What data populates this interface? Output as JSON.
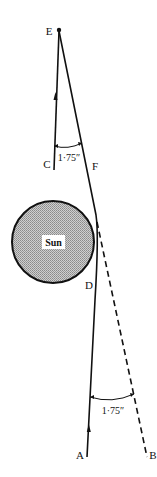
{
  "diagram": {
    "title": "",
    "points": {
      "E": "E",
      "C": "C",
      "F": "F",
      "D": "D",
      "A": "A",
      "B": "B"
    },
    "sun_label": "Sun",
    "angles": {
      "top": "1·75″",
      "bottom": "1·75″"
    },
    "colors": {
      "line": "#111111",
      "sun_fill": "#b5b5b5",
      "sun_stroke": "#111111",
      "background": "#ffffff"
    }
  }
}
